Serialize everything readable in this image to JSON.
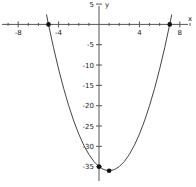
{
  "chart_data": {
    "type": "line",
    "title": "",
    "xlabel": "x",
    "ylabel": "y",
    "grid": false,
    "legend": false,
    "xlim": [
      -9.8,
      9.6
    ],
    "ylim": [
      -40,
      6
    ],
    "x_ticks": [
      -8,
      -4,
      4,
      8
    ],
    "x_tick_labels": [
      "-8",
      "-4",
      "4",
      "8"
    ],
    "x_minor_ticks": [
      -9,
      -7,
      -6,
      -5,
      -3,
      -2,
      -1,
      1,
      2,
      3,
      5,
      6,
      7,
      9
    ],
    "y_ticks": [
      5,
      -5,
      -10,
      -15,
      -20,
      -25,
      -30,
      -35
    ],
    "y_tick_labels": [
      "5",
      "-5",
      "-10",
      "-15",
      "-20",
      "-25",
      "-30",
      "-35"
    ],
    "curve": {
      "equation": "y = x^2 - 2x - 35",
      "a": 1,
      "b": -2,
      "c": -35,
      "color": "#444444",
      "x": [
        -5.2,
        -5.0,
        -4.5,
        -4.0,
        -3.5,
        -3.0,
        -2.5,
        -2.0,
        -1.5,
        -1.0,
        -0.5,
        0.0,
        0.5,
        1.0,
        1.5,
        2.0,
        2.5,
        3.0,
        3.5,
        4.0,
        4.5,
        5.0,
        5.5,
        6.0,
        6.5,
        7.0,
        7.2
      ],
      "y": [
        2.44,
        0.0,
        -5.75,
        -11.0,
        -15.75,
        -20.0,
        -23.75,
        -27.0,
        -29.75,
        -32.0,
        -33.75,
        -35.0,
        -35.75,
        -36.0,
        -35.75,
        -35.0,
        -33.75,
        -32.0,
        -29.75,
        -27.0,
        -23.75,
        -20.0,
        -15.75,
        -11.0,
        -5.75,
        0.0,
        2.44
      ]
    },
    "points": [
      {
        "label": "x-intercept-left",
        "x": -5,
        "y": 0
      },
      {
        "label": "x-intercept-right",
        "x": 7,
        "y": 0
      },
      {
        "label": "y-intercept",
        "x": 0,
        "y": -35
      },
      {
        "label": "vertex",
        "x": 1,
        "y": -36
      }
    ],
    "axis_color": "#555555",
    "point_color": "#111111"
  },
  "axes": {
    "x_axis_label": "x",
    "y_axis_label": "y"
  }
}
